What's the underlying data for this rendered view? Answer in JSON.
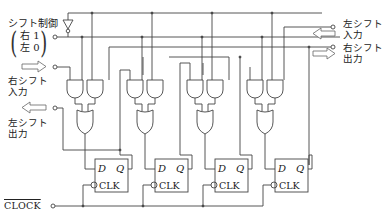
{
  "diagram": {
    "type": "4-bit bidirectional shift register",
    "labels": {
      "shift_control": "シフト制御",
      "shift_control_right": "右 1",
      "shift_control_left": "左 0",
      "right_shift_input_line1": "右シフト",
      "right_shift_input_line2": "入力",
      "left_shift_output_line1": "左シフト",
      "left_shift_output_line2": "出力",
      "left_shift_input_line1": "左シフト",
      "left_shift_input_line2": "入力",
      "right_shift_output_line1": "右シフト",
      "right_shift_output_line2": "出力",
      "clock": "CLOCK"
    },
    "flip_flops": [
      {
        "d": "D",
        "q": "Q",
        "clk": "CLK"
      },
      {
        "d": "D",
        "q": "Q",
        "clk": "CLK"
      },
      {
        "d": "D",
        "q": "Q",
        "clk": "CLK"
      },
      {
        "d": "D",
        "q": "Q",
        "clk": "CLK"
      }
    ],
    "stages": 4,
    "colors": {
      "line": "#444444",
      "arrow": "#666666",
      "background": "#ffffff"
    }
  }
}
